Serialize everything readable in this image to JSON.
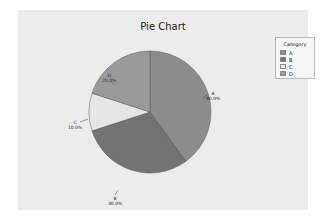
{
  "chart_data": {
    "type": "pie",
    "title": "Pie Chart",
    "categories": [
      "A",
      "B",
      "C",
      "D"
    ],
    "values": [
      40.0,
      30.0,
      10.0,
      20.0
    ],
    "labels": [
      "40.0%",
      "30.0%",
      "10.0%",
      "20.0%"
    ],
    "colors": [
      "#8c8c8c",
      "#737373",
      "#e6e6e6",
      "#9a9a9a"
    ],
    "legend": {
      "title": "Category",
      "position": "right",
      "entries": [
        "A",
        "B",
        "C",
        "D"
      ]
    },
    "start_angle_deg": 90,
    "direction": "clockwise"
  }
}
